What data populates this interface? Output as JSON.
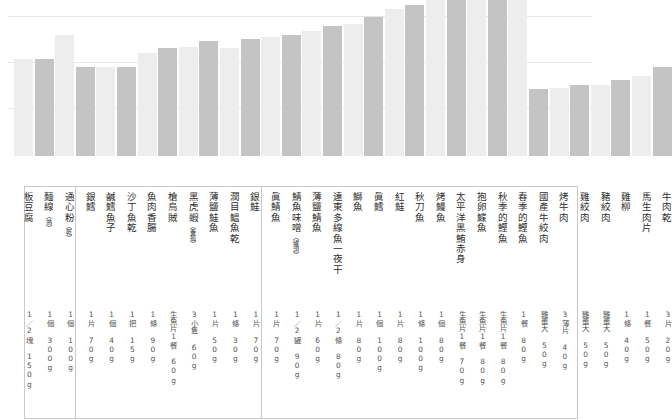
{
  "chart_data": {
    "type": "bar",
    "title": "",
    "xlabel": "",
    "ylabel": "",
    "grid": true,
    "gridline_count": 3,
    "legend": [],
    "categories": [
      "板豆腐",
      "麵線（熟）",
      "通心粉（乾）",
      "銀鱈",
      "鹹鱈魚子",
      "沙丁魚乾",
      "魚肉香腸",
      "槍烏賊",
      "黑虎蝦（養殖）",
      "薄鹽鮭魚",
      "潤目鰮魚乾",
      "銀鮭",
      "眞鯖魚",
      "鯖魚味噌（罐頭）",
      "薄鹽鯖魚",
      "遠東多線魚一夜干",
      "鰤魚",
      "眞鱈",
      "紅鮭",
      "秋刀魚",
      "烤鰻魚",
      "太平洋黑鮪赤身",
      "抱卵鰈魚",
      "秋季的鰹魚",
      "春季的鰹魚",
      "國產牛絞肉",
      "烤牛肉",
      "雞絞肉",
      "豬絞肉",
      "雞柳",
      "馬生肉片",
      "牛肉乾"
    ],
    "values": [
      81,
      81,
      101,
      74,
      74,
      74,
      86,
      90,
      91,
      96,
      90,
      97,
      99,
      101,
      104,
      108,
      110,
      116,
      122,
      126,
      130,
      133,
      137,
      140,
      144,
      56,
      57,
      59,
      59,
      63,
      67,
      74
    ],
    "bar_shades": [
      "light",
      "dark",
      "light",
      "dark",
      "light",
      "dark",
      "light",
      "dark",
      "light",
      "dark",
      "light",
      "dark",
      "light",
      "dark",
      "light",
      "dark",
      "light",
      "dark",
      "light",
      "dark",
      "light",
      "dark",
      "light",
      "dark",
      "light",
      "dark",
      "light",
      "dark",
      "light",
      "dark",
      "light",
      "dark"
    ],
    "serving_sizes": [
      "1／2塊 150g",
      "1個 300g",
      "1個 100g",
      "1片 70g",
      "1個 40g",
      "1把 15g",
      "1條 90g",
      "生魚片1餐 60g",
      "3小隻 60g",
      "1片 50g",
      "1條 30g",
      "1片 70g",
      "1片 70g",
      "1／2罐 90g",
      "1片 60g",
      "1／2條 80g",
      "1片 80g",
      "1個 100g",
      "1片 80g",
      "1條 100g",
      "1個 80g",
      "生魚片1餐 70g",
      "生魚片1餐 80g",
      "生魚片1餐 80g",
      "1餐 80g",
      "雞蛋大 50g",
      "3薄片 40g",
      "雞蛋大 50g",
      "雞蛋大 50g",
      "1條 40g",
      "1餐 50g",
      "3片 20g"
    ],
    "section_breaks_after_index": [
      2,
      24
    ],
    "colors": {
      "bar_light": "#ededed",
      "bar_dark": "#c4c4c4",
      "gridline": "#e6e6e6",
      "rule": "#c9c9c9",
      "text": "#2e2e2e",
      "background": "#ffffff"
    },
    "axis": {
      "baseline_y": 186,
      "gridlines_y": [
        16,
        62,
        108
      ],
      "ylim": [
        0,
        160
      ]
    }
  }
}
